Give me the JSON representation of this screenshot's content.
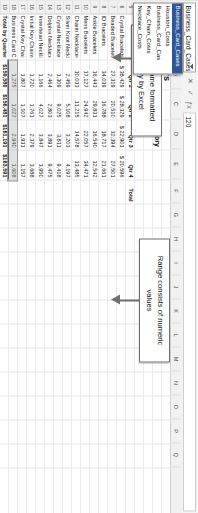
{
  "app": {
    "name_box_value": "Business_Card_Cases",
    "formula_bar_value": "120",
    "cancel_icon": "cancel-x-icon",
    "enter_icon": "enter-check-icon",
    "fx_icon": "fx-function-icon",
    "name_box_caret_icon": "chevron-down-icon"
  },
  "name_box_dropdown": {
    "items": [
      {
        "label": "Business_Card_Cases",
        "selected": true
      },
      {
        "label": "Houston_Costs",
        "selected": false
      },
      {
        "label": "Business_Card_Cas",
        "selected": false
      },
      {
        "label": "Key_Chain_Costs",
        "selected": false
      },
      {
        "label": "Necklace_Costs",
        "selected": false
      }
    ]
  },
  "sheet": {
    "columns": [
      "A",
      "B",
      "C",
      "D",
      "E",
      "F",
      "G",
      "H",
      "I",
      "J",
      "K",
      "L",
      "M",
      "N",
      "O",
      "P",
      "Q"
    ],
    "rows": [
      "1",
      "2",
      "3",
      "4",
      "5",
      "6",
      "7",
      "8",
      "9",
      "10",
      "11",
      "12",
      "13",
      "14",
      "15",
      "16",
      "17",
      "18",
      "19",
      "20"
    ],
    "titles": {
      "company": "Jesse Jewelers",
      "subtitle": "Costs by Quarter, Small Items Category",
      "store": "Houston Store"
    },
    "table": {
      "row_label_header": "",
      "column_headers": [
        "Qtr 1",
        "Qtr 2",
        "Qtr 3",
        "Qtr 4",
        "Total"
      ],
      "rows": [
        {
          "label": "Crystal Bracelets",
          "values": [
            "$  38,429",
            "$  28,329",
            "$  22,901",
            "$  20,596",
            ""
          ]
        },
        {
          "label": "Beaded Bracelets",
          "values": [
            "27,319",
            "20,510",
            "32,394",
            "27,501",
            ""
          ]
        },
        {
          "label": "ID Bracelets",
          "values": [
            "34,039",
            "16,788",
            "18,717",
            "21,661",
            ""
          ]
        },
        {
          "label": "Ankle Bracelets",
          "values": [
            "16,443",
            "29,831",
            "16,540",
            "12,542",
            ""
          ]
        },
        {
          "label": "Mens Bracelets",
          "values": [
            "17,127",
            "24,942",
            "22,057",
            "34,471",
            ""
          ]
        },
        {
          "label": "Charm Necklaces",
          "values": [
            "10,033",
            "11,215",
            "14,578",
            "13,485",
            ""
          ]
        },
        {
          "label": "Silver Knot Necklaces",
          "values": [
            "2,459",
            "5,108",
            "3,203",
            "4,197",
            ""
          ]
        },
        {
          "label": "Crystal Necklaces",
          "values": [
            "1,309",
            "9,025",
            "3,811",
            "9,418",
            ""
          ]
        },
        {
          "label": "Dolphin Necklaces",
          "values": [
            "2,464",
            "2,803",
            "3,891",
            "9,475",
            ""
          ]
        },
        {
          "label": "Innerheart Necklaces",
          "values": [
            "1,166",
            "4,027",
            "3,847",
            "3,950",
            ""
          ]
        },
        {
          "label": "Initial Key Chains",
          "values": [
            "1,720",
            "1,761",
            "2,379",
            "3,688",
            ""
          ]
        },
        {
          "label": "Crystal Key Chains",
          "values": [
            "1,807",
            "1,107",
            "1,931",
            "1,157",
            ""
          ]
        },
        {
          "label": "Business Card Cases",
          "values": [
            "1,275",
            "1,027",
            "2,940",
            "1,608",
            ""
          ]
        },
        {
          "label": "Total by Quarter",
          "values": [
            "$159,580",
            "$156,481",
            "$161,191",
            "$163,591",
            ""
          ]
        }
      ]
    },
    "selected_cell_display": "1,608"
  },
  "annotations": [
    {
      "id": "defined-name-callout",
      "text": "Defined name formatted properly by Excel"
    },
    {
      "id": "numeric-range-callout",
      "text": "Range consists of numeric values"
    }
  ],
  "colors": {
    "chrome_bg": "#f3f3f3",
    "grid_line": "#e8e8e8",
    "header_bg": "#f1f1f1",
    "selection_fill": "#aaaaaa",
    "callout_border": "#6f6f6f",
    "dropdown_selected": "#2f5597"
  }
}
